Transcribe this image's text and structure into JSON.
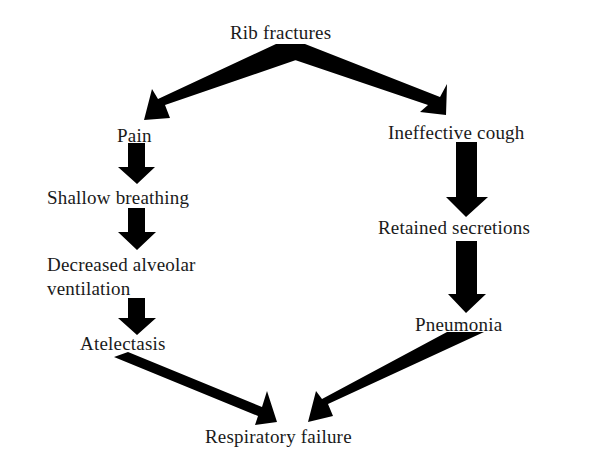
{
  "diagram": {
    "nodes": {
      "rib_fractures": "Rib fractures",
      "pain": "Pain",
      "shallow_breathing": "Shallow breathing",
      "decreased_alveolar_1": "Decreased alveolar",
      "decreased_alveolar_2": "ventilation",
      "atelectasis": "Atelectasis",
      "ineffective_cough": "Ineffective cough",
      "retained_secretions": "Retained secretions",
      "pneumonia": "Pneumonia",
      "respiratory_failure": "Respiratory failure"
    },
    "edges": [
      {
        "from": "Rib fractures",
        "to": "Pain"
      },
      {
        "from": "Rib fractures",
        "to": "Ineffective cough"
      },
      {
        "from": "Pain",
        "to": "Shallow breathing"
      },
      {
        "from": "Shallow breathing",
        "to": "Decreased alveolar ventilation"
      },
      {
        "from": "Decreased alveolar ventilation",
        "to": "Atelectasis"
      },
      {
        "from": "Ineffective cough",
        "to": "Retained secretions"
      },
      {
        "from": "Retained secretions",
        "to": "Pneumonia"
      },
      {
        "from": "Atelectasis",
        "to": "Respiratory failure"
      },
      {
        "from": "Pneumonia",
        "to": "Respiratory failure"
      }
    ],
    "colors": {
      "arrow": "#000000",
      "text": "#1a1a1a",
      "background": "#ffffff"
    }
  }
}
